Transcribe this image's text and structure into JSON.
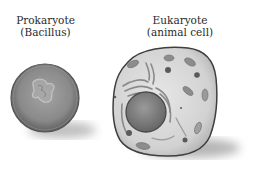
{
  "prokaryote": {
    "title": "Prokaryote",
    "subtitle": "(Bacillus)"
  },
  "eukaryote": {
    "title": "Eukaryote",
    "subtitle": "(animal cell)"
  },
  "colors": {
    "membrane": "#4a4a4a",
    "prokaryote_fill": "#8e8e8e",
    "eukaryote_fill": "#d6d6d6",
    "nucleus": "#7a7a7a",
    "organelle": "#8a8a8a",
    "shadow": "#9a9a9a"
  }
}
